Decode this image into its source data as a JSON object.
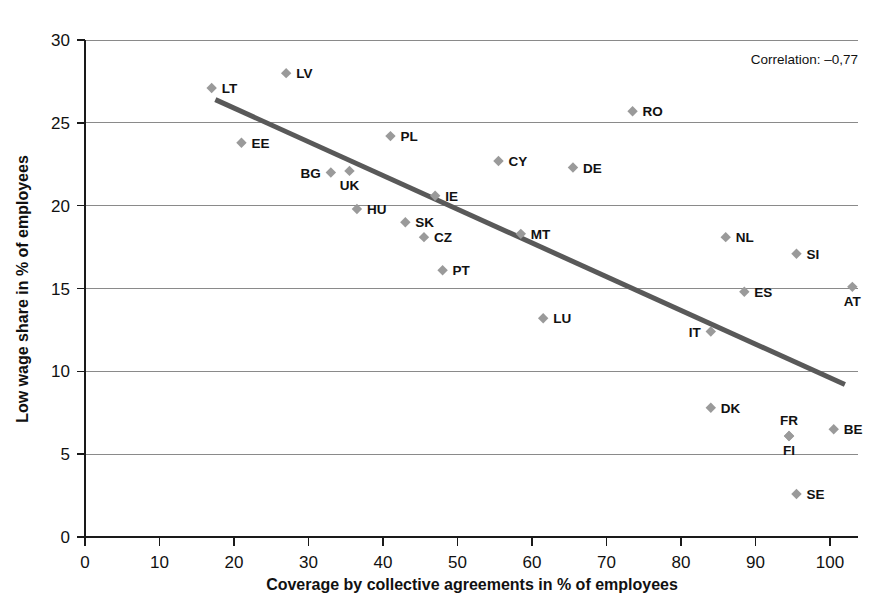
{
  "chart_data": {
    "type": "scatter",
    "title": "",
    "xlabel": "Coverage by collective agreements in % of employees",
    "ylabel": "Low wage share in % of employees",
    "xlim": [
      0,
      100
    ],
    "ylim": [
      0,
      30
    ],
    "xticks": [
      0,
      10,
      20,
      30,
      40,
      50,
      60,
      70,
      80,
      90,
      100
    ],
    "yticks": [
      0,
      5,
      10,
      15,
      20,
      25,
      30
    ],
    "grid": "horizontal",
    "legend": "none",
    "annotations": [
      {
        "name": "correlation",
        "text": "Correlation: –0,77"
      }
    ],
    "trendline": {
      "type": "linear",
      "x_start": 17.5,
      "y_start": 26.4,
      "x_end": 102.0,
      "y_end": 9.2
    },
    "points": [
      {
        "label": "LT",
        "x": 17.0,
        "y": 27.1,
        "label_pos": "right"
      },
      {
        "label": "LV",
        "x": 27.0,
        "y": 28.0,
        "label_pos": "right"
      },
      {
        "label": "EE",
        "x": 21.0,
        "y": 23.8,
        "label_pos": "right"
      },
      {
        "label": "PL",
        "x": 41.0,
        "y": 24.2,
        "label_pos": "right"
      },
      {
        "label": "BG",
        "x": 33.0,
        "y": 22.0,
        "label_pos": "left"
      },
      {
        "label": "UK",
        "x": 35.5,
        "y": 22.1,
        "label_pos": "below"
      },
      {
        "label": "HU",
        "x": 36.5,
        "y": 19.8,
        "label_pos": "right"
      },
      {
        "label": "IE",
        "x": 47.0,
        "y": 20.6,
        "label_pos": "right"
      },
      {
        "label": "SK",
        "x": 43.0,
        "y": 19.0,
        "label_pos": "right"
      },
      {
        "label": "CZ",
        "x": 45.5,
        "y": 18.1,
        "label_pos": "right"
      },
      {
        "label": "PT",
        "x": 48.0,
        "y": 16.1,
        "label_pos": "right"
      },
      {
        "label": "CY",
        "x": 55.5,
        "y": 22.7,
        "label_pos": "right"
      },
      {
        "label": "DE",
        "x": 65.5,
        "y": 22.3,
        "label_pos": "right"
      },
      {
        "label": "RO",
        "x": 73.5,
        "y": 25.7,
        "label_pos": "right"
      },
      {
        "label": "MT",
        "x": 58.5,
        "y": 18.3,
        "label_pos": "right"
      },
      {
        "label": "LU",
        "x": 61.5,
        "y": 13.2,
        "label_pos": "right"
      },
      {
        "label": "IT",
        "x": 84.0,
        "y": 12.4,
        "label_pos": "left"
      },
      {
        "label": "NL",
        "x": 86.0,
        "y": 18.1,
        "label_pos": "right"
      },
      {
        "label": "SI",
        "x": 95.5,
        "y": 17.1,
        "label_pos": "right"
      },
      {
        "label": "ES",
        "x": 88.5,
        "y": 14.8,
        "label_pos": "right"
      },
      {
        "label": "AT",
        "x": 103.0,
        "y": 15.1,
        "label_pos": "below"
      },
      {
        "label": "DK",
        "x": 84.0,
        "y": 7.8,
        "label_pos": "right"
      },
      {
        "label": "FR",
        "x": 94.5,
        "y": 6.1,
        "label_pos": "above"
      },
      {
        "label": "FI",
        "x": 94.5,
        "y": 6.1,
        "label_pos": "below"
      },
      {
        "label": "BE",
        "x": 100.5,
        "y": 6.5,
        "label_pos": "right"
      },
      {
        "label": "SE",
        "x": 95.5,
        "y": 2.6,
        "label_pos": "right"
      }
    ]
  },
  "colors": {
    "marker": "#9a9a9a",
    "trendline": "#595959",
    "gridline": "#8a8a8a",
    "axis": "#1a1a1a",
    "background": "#ffffff"
  }
}
